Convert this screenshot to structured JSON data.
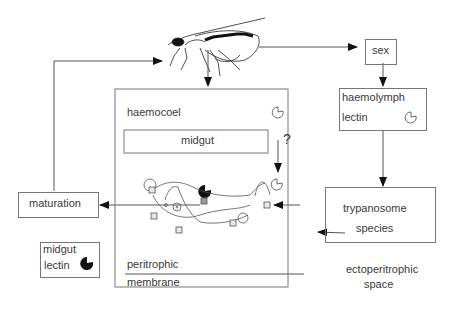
{
  "diagram": {
    "nodes": {
      "sex": "sex",
      "haemolymph": "haemolymph",
      "haemolymph_lectin": "lectin",
      "haemocoel": "haemocoel",
      "midgut": "midgut",
      "question": "?",
      "maturation": "maturation",
      "trypanosome": "trypanosome",
      "species": "species",
      "midgut_lectin_1": "midgut",
      "midgut_lectin_2": "lectin",
      "peritrophic": "peritrophic",
      "membrane": "membrane",
      "ectoperitrophic_1": "ectoperitrophic",
      "ectoperitrophic_2": "space"
    },
    "icons": [
      "tsetse-fly-icon",
      "haemolymph-lectin-icon",
      "midgut-lectin-icon",
      "trypanosome-icon"
    ],
    "colors": {
      "line": "#555555",
      "box": "#777777",
      "text": "#3a3a3a",
      "lectin_fill": "#111111"
    }
  }
}
